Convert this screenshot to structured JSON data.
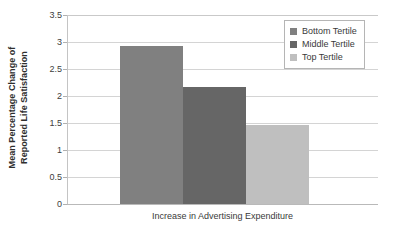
{
  "chart_data": {
    "type": "bar",
    "title": "",
    "categories": [
      "Bottom Tertile",
      "Middle Tertile",
      "Top Tertile"
    ],
    "values": [
      2.93,
      2.17,
      1.46
    ],
    "xlabel": "Increase in Advertising Expenditure",
    "ylabel": "Mean Percentage Change of Reported Life Satisfaction",
    "ylabel_lines": [
      "Mean Percentage Change of",
      "Reported Life Satisfaction"
    ],
    "ylim": [
      0,
      3.5
    ],
    "ytick_labels": [
      "0",
      "0.5",
      "1",
      "1.5",
      "2",
      "2.5",
      "3",
      "3.5"
    ],
    "ytick_values": [
      0,
      0.5,
      1,
      1.5,
      2,
      2.5,
      3,
      3.5
    ],
    "xtick_labels": [],
    "grid": true,
    "legend_position": "top-right",
    "series": [
      {
        "name": "Bottom Tertile",
        "value": 2.93,
        "color": "#808080"
      },
      {
        "name": "Middle Tertile",
        "value": 2.17,
        "color": "#666666"
      },
      {
        "name": "Top Tertile",
        "value": 1.46,
        "color": "#bfbfbf"
      }
    ],
    "colors": {
      "bottom_tertile": "#808080",
      "middle_tertile": "#666666",
      "top_tertile": "#bfbfbf",
      "gridline": "#d4d4d4",
      "axis": "#b9b9b9",
      "text": "#3a3a3a",
      "background": "#ffffff"
    }
  },
  "legend": {
    "items": [
      {
        "label": "Bottom Tertile",
        "color": "#808080"
      },
      {
        "label": "Middle Tertile",
        "color": "#666666"
      },
      {
        "label": "Top Tertile",
        "color": "#bfbfbf"
      }
    ]
  }
}
